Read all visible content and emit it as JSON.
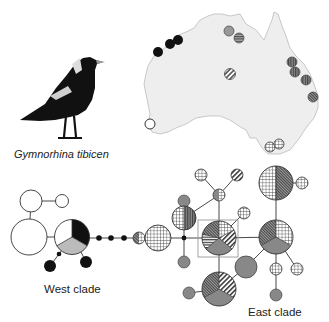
{
  "figure": {
    "species_name": "Gymnorhina tibicen",
    "west_clade_label": "West clade",
    "east_clade_label": "East clade"
  },
  "legend_patterns": {
    "white": "West clade haplotype (white)",
    "black": "black",
    "light_grey": "light grey",
    "dark_grey": "dark grey",
    "horizontal_stripes": "horizontal stripes",
    "vertical_stripes": "vertical stripes",
    "diagonal_stripes": "diagonal stripes",
    "dense_diagonal": "dense diagonal hatch",
    "grid": "crosshatch grid"
  },
  "map": {
    "region": "Australia",
    "sample_sites": [
      {
        "x": 158,
        "y": 52,
        "pattern": "black"
      },
      {
        "x": 170,
        "y": 44,
        "pattern": "black"
      },
      {
        "x": 178,
        "y": 40,
        "pattern": "black"
      },
      {
        "x": 229,
        "y": 31,
        "pattern": "dark_grey"
      },
      {
        "x": 239,
        "y": 38,
        "pattern": "horizontal_stripes"
      },
      {
        "x": 230,
        "y": 74,
        "pattern": "diagonal_stripes"
      },
      {
        "x": 292,
        "y": 62,
        "pattern": "vertical_stripes"
      },
      {
        "x": 295,
        "y": 72,
        "pattern": "vertical_stripes"
      },
      {
        "x": 306,
        "y": 80,
        "pattern": "vertical_stripes"
      },
      {
        "x": 313,
        "y": 97,
        "pattern": "dense_diagonal"
      },
      {
        "x": 150,
        "y": 124,
        "pattern": "white"
      },
      {
        "x": 270,
        "y": 147,
        "pattern": "grid"
      },
      {
        "x": 279,
        "y": 144,
        "pattern": "grid"
      }
    ]
  },
  "network": {
    "nodes": [
      {
        "id": "w1",
        "x": 31,
        "y": 201,
        "r": 11,
        "slices": [
          "white"
        ]
      },
      {
        "id": "w2",
        "x": 62,
        "y": 201,
        "r": 6.5,
        "slices": [
          "white"
        ]
      },
      {
        "id": "w3",
        "x": 29,
        "y": 237,
        "r": 18,
        "slices": [
          "white"
        ]
      },
      {
        "id": "w4",
        "x": 72,
        "y": 237,
        "r": 17.5,
        "slices": [
          "black",
          "light_grey",
          "white"
        ]
      },
      {
        "id": "w5",
        "x": 50,
        "y": 266,
        "r": 6,
        "slices": [
          "black"
        ]
      },
      {
        "id": "w6",
        "x": 86,
        "y": 262,
        "r": 6,
        "slices": [
          "black"
        ]
      },
      {
        "id": "c1",
        "x": 139,
        "y": 238,
        "r": 6,
        "slices": [
          "white_grid",
          "dense_diagonal"
        ]
      },
      {
        "id": "c2",
        "x": 158,
        "y": 238,
        "r": 13,
        "slices": [
          "grid"
        ]
      },
      {
        "id": "e1",
        "x": 184,
        "y": 201,
        "r": 6,
        "slices": [
          "dark_grey"
        ]
      },
      {
        "id": "e2",
        "x": 184,
        "y": 218,
        "r": 12,
        "slices": [
          "grid",
          "vertical_stripes"
        ]
      },
      {
        "id": "e3",
        "x": 184,
        "y": 262,
        "r": 6,
        "slices": [
          "dark_grey"
        ]
      },
      {
        "id": "e4",
        "x": 201,
        "y": 175,
        "r": 6,
        "slices": [
          "grid"
        ]
      },
      {
        "id": "e5",
        "x": 237,
        "y": 175,
        "r": 6,
        "slices": [
          "diagonal_stripes"
        ]
      },
      {
        "id": "e6",
        "x": 219,
        "y": 195,
        "r": 6,
        "slices": [
          "dark_grey_grid"
        ]
      },
      {
        "id": "e7",
        "x": 244,
        "y": 213,
        "r": 6,
        "slices": [
          "grid"
        ]
      },
      {
        "id": "e8",
        "x": 219,
        "y": 238,
        "r": 17,
        "slices": [
          "grid",
          "diagonal_stripes",
          "dark_grey",
          "horizontal_stripes",
          "dense_diagonal"
        ]
      },
      {
        "id": "e9",
        "x": 276,
        "y": 183,
        "r": 17,
        "slices": [
          "grid",
          "dense_diagonal"
        ]
      },
      {
        "id": "e10",
        "x": 302,
        "y": 183,
        "r": 6,
        "slices": [
          "grid"
        ]
      },
      {
        "id": "e11",
        "x": 276,
        "y": 237,
        "r": 17,
        "slices": [
          "grid",
          "dark_grey",
          "dense_diagonal"
        ]
      },
      {
        "id": "e12",
        "x": 246,
        "y": 267,
        "r": 11,
        "slices": [
          "dark_grey"
        ]
      },
      {
        "id": "e13",
        "x": 276,
        "y": 269,
        "r": 6,
        "slices": [
          "grid"
        ]
      },
      {
        "id": "e14",
        "x": 297,
        "y": 269,
        "r": 6,
        "slices": [
          "grid"
        ]
      },
      {
        "id": "e15",
        "x": 276,
        "y": 295,
        "r": 6,
        "slices": [
          "dark_grey"
        ]
      },
      {
        "id": "e16",
        "x": 219,
        "y": 289,
        "r": 17,
        "slices": [
          "diagonal_stripes",
          "dark_grey",
          "dense_diagonal"
        ]
      },
      {
        "id": "e17",
        "x": 189,
        "y": 293,
        "r": 6,
        "slices": [
          "dark_grey"
        ]
      }
    ],
    "median_vectors": [
      {
        "x": 59,
        "y": 254
      },
      {
        "x": 99,
        "y": 238
      },
      {
        "x": 111,
        "y": 238
      },
      {
        "x": 124,
        "y": 238
      },
      {
        "x": 184,
        "y": 238
      }
    ],
    "highlight_box": {
      "x": 198,
      "y": 220,
      "w": 40,
      "h": 37
    }
  }
}
